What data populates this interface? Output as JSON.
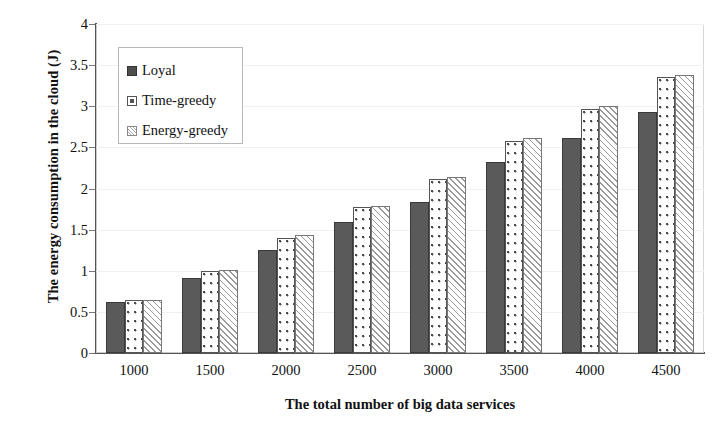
{
  "chart_data": {
    "type": "bar",
    "title": "",
    "xlabel": "The total number of big data services",
    "ylabel": "The energy consumption in the cloud  (J)",
    "categories": [
      "1000",
      "1500",
      "2000",
      "2500",
      "3000",
      "3500",
      "4000",
      "4500"
    ],
    "series": [
      {
        "name": "Loyal",
        "values": [
          0.62,
          0.91,
          1.25,
          1.59,
          1.84,
          2.32,
          2.62,
          2.93
        ]
      },
      {
        "name": "Time-greedy",
        "values": [
          0.65,
          1.0,
          1.4,
          1.77,
          2.11,
          2.58,
          2.97,
          3.35
        ]
      },
      {
        "name": "Energy-greedy",
        "values": [
          0.65,
          1.01,
          1.43,
          1.79,
          2.14,
          2.61,
          3.0,
          3.38
        ]
      }
    ],
    "ylim": [
      0,
      4
    ],
    "ytick_labels": [
      "0",
      "0.5",
      "1",
      "1.5",
      "2",
      "2.5",
      "3",
      "3.5",
      "4"
    ],
    "ytick_values": [
      0,
      0.5,
      1,
      1.5,
      2,
      2.5,
      3,
      3.5,
      4
    ],
    "grid": true,
    "legend_position": "top-left",
    "colors": {
      "loyal": "#5a5a5a",
      "time_greedy": "#ffffff",
      "energy_greedy": "#fbfbfb",
      "axis": "#555555",
      "grid": "#f0f0f0",
      "text": "#111111"
    }
  }
}
